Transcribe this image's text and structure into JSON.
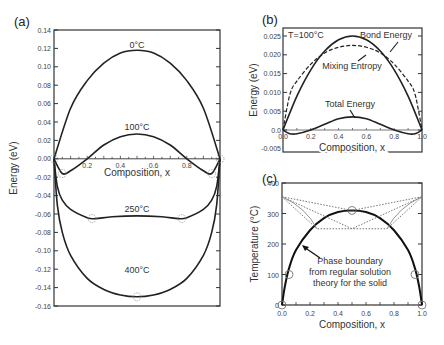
{
  "chart_data": [
    {
      "panel": "(a)",
      "type": "line",
      "title": "",
      "xlabel": "Composition, x",
      "ylabel": "Energy (eV)",
      "xlim": [
        0,
        1
      ],
      "ylim": [
        -0.16,
        0.14
      ],
      "xticks": [
        "0.2",
        "0.4",
        "0.6",
        "0.8"
      ],
      "yticks": [
        "0.14",
        "0.12",
        "0.10",
        "0.08",
        "0.06",
        "0.04",
        "0.02",
        "0.00",
        "-0.02",
        "-0.04",
        "-0.06",
        "-0.08",
        "-0.10",
        "-0.12",
        "-0.14",
        "-0.16"
      ],
      "series": [
        {
          "name": "0°C",
          "x": [
            0,
            0.1,
            0.2,
            0.3,
            0.4,
            0.5,
            0.6,
            0.7,
            0.8,
            0.9,
            1.0
          ],
          "values": [
            0,
            0.055,
            0.085,
            0.104,
            0.115,
            0.118,
            0.115,
            0.104,
            0.085,
            0.055,
            0
          ]
        },
        {
          "name": "100°C",
          "x": [
            0,
            0.05,
            0.1,
            0.2,
            0.3,
            0.4,
            0.5,
            0.6,
            0.7,
            0.8,
            0.9,
            0.95,
            1.0
          ],
          "values": [
            0,
            -0.016,
            -0.013,
            0.0,
            0.015,
            0.024,
            0.027,
            0.024,
            0.015,
            0.0,
            -0.013,
            -0.016,
            0
          ]
        },
        {
          "name": "250°C",
          "x": [
            0,
            0.02,
            0.05,
            0.1,
            0.2,
            0.25,
            0.35,
            0.5,
            0.65,
            0.75,
            0.8,
            0.9,
            0.95,
            0.98,
            1.0
          ],
          "values": [
            0,
            -0.03,
            -0.045,
            -0.055,
            -0.064,
            -0.065,
            -0.063,
            -0.062,
            -0.063,
            -0.065,
            -0.064,
            -0.055,
            -0.045,
            -0.03,
            0
          ]
        },
        {
          "name": "400°C",
          "x": [
            0,
            0.02,
            0.05,
            0.1,
            0.2,
            0.3,
            0.4,
            0.5,
            0.6,
            0.7,
            0.8,
            0.9,
            0.95,
            0.98,
            1.0
          ],
          "values": [
            0,
            -0.05,
            -0.08,
            -0.105,
            -0.13,
            -0.142,
            -0.148,
            -0.15,
            -0.148,
            -0.142,
            -0.13,
            -0.105,
            -0.08,
            -0.05,
            0
          ]
        }
      ],
      "markers": [
        {
          "x": 0.05,
          "y": -0.016
        },
        {
          "x": 0.95,
          "y": -0.016
        },
        {
          "x": 0.23,
          "y": -0.065
        },
        {
          "x": 0.77,
          "y": -0.065
        },
        {
          "x": 0.5,
          "y": -0.15
        },
        {
          "x": 0.0,
          "y": 0.0
        },
        {
          "x": 1.0,
          "y": 0.0
        }
      ],
      "labels": {
        "t0": "0°C",
        "t100": "100°C",
        "t250": "250°C",
        "t400": "400°C"
      },
      "grid": false
    },
    {
      "panel": "(b)",
      "type": "line",
      "xlabel": "Composition, x",
      "ylabel": "Energy (eV)",
      "xlim": [
        0,
        1
      ],
      "ylim": [
        -0.005,
        0.027
      ],
      "xticks": [
        "0.0",
        "0.2",
        "0.4",
        "0.6",
        "0.8",
        "1.0"
      ],
      "yticks": [
        "0.025",
        "0.020",
        "0.015",
        "0.010",
        "0.005",
        "0.0",
        "-0.005"
      ],
      "annotation": "T=100°C",
      "series": [
        {
          "name": "Bond Energy",
          "x": [
            0,
            0.1,
            0.2,
            0.3,
            0.4,
            0.5,
            0.6,
            0.7,
            0.8,
            0.9,
            1.0
          ],
          "values": [
            0,
            0.009,
            0.016,
            0.021,
            0.024,
            0.025,
            0.024,
            0.021,
            0.016,
            0.009,
            0
          ]
        },
        {
          "name": "Mixing Entropy",
          "style": "dashed",
          "x": [
            0,
            0.05,
            0.1,
            0.2,
            0.3,
            0.4,
            0.5,
            0.6,
            0.7,
            0.8,
            0.9,
            0.95,
            1.0
          ],
          "values": [
            0,
            0.0095,
            0.013,
            0.0175,
            0.0205,
            0.022,
            0.0225,
            0.022,
            0.0205,
            0.0175,
            0.013,
            0.0095,
            0
          ]
        },
        {
          "name": "Total Energy",
          "x": [
            0,
            0.05,
            0.1,
            0.2,
            0.3,
            0.4,
            0.5,
            0.6,
            0.7,
            0.8,
            0.9,
            0.95,
            1.0
          ],
          "values": [
            0,
            -0.001,
            -0.001,
            0.0,
            0.0015,
            0.003,
            0.0035,
            0.003,
            0.0015,
            0.0,
            -0.001,
            -0.001,
            0
          ]
        }
      ],
      "labels": {
        "bond": "Bond Energy",
        "entropy": "Mixing Entropy",
        "total": "Total Energy",
        "temp": "T=100°C"
      }
    },
    {
      "panel": "(c)",
      "type": "line",
      "xlabel": "Composition, x",
      "ylabel": "Temperature (°C)",
      "xlim": [
        0,
        1
      ],
      "ylim": [
        0,
        400
      ],
      "xticks": [
        "0.0",
        "0.2",
        "0.4",
        "0.6",
        "0.8",
        "1.0"
      ],
      "yticks": [
        "400",
        "300",
        "200",
        "100",
        "0"
      ],
      "series": [
        {
          "name": "Phase boundary",
          "x": [
            0,
            0.02,
            0.05,
            0.1,
            0.2,
            0.3,
            0.4,
            0.5,
            0.6,
            0.7,
            0.8,
            0.9,
            0.95,
            0.98,
            1.0
          ],
          "values": [
            0,
            60,
            120,
            180,
            245,
            285,
            305,
            310,
            305,
            285,
            245,
            180,
            120,
            60,
            0
          ]
        },
        {
          "name": "Liquidus (dotted)",
          "style": "dotted",
          "x": [
            0,
            0.5,
            1.0
          ],
          "values": [
            355,
            250,
            355
          ]
        },
        {
          "name": "Eutectic lines (dotted)",
          "style": "dotted",
          "x": [
            0,
            0.25,
            0.75,
            1.0
          ],
          "values": [
            355,
            250,
            250,
            355
          ]
        },
        {
          "name": "Top line (dotted)",
          "style": "dotted",
          "x": [
            0,
            0.5,
            1.0
          ],
          "values": [
            355,
            310,
            355
          ]
        }
      ],
      "markers": [
        {
          "x": 0,
          "y": 0
        },
        {
          "x": 1,
          "y": 0
        },
        {
          "x": 0.5,
          "y": 310
        },
        {
          "x": 0.05,
          "y": 100
        },
        {
          "x": 0.95,
          "y": 100
        }
      ],
      "annotation": "Phase boundary from regular solution theory for the solid",
      "labels": {
        "line1": "Phase boundary",
        "line2": "from regular solution",
        "line3": "theory for the solid"
      }
    }
  ],
  "panels": {
    "a": "(a)",
    "b": "(b)",
    "c": "(c)"
  }
}
